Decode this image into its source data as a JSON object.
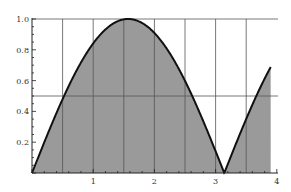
{
  "chart_data": {
    "type": "area",
    "title": "",
    "xlabel": "",
    "ylabel": "",
    "function": "|sin(x)|",
    "xlim": [
      0,
      4
    ],
    "ylim": [
      0,
      1.0
    ],
    "x_ticks": [
      "1",
      "2",
      "3",
      "4"
    ],
    "y_ticks": [
      "0.2",
      "0.4",
      "0.6",
      "0.8",
      "1.0"
    ],
    "grid": {
      "vertical": [
        0.5,
        1,
        1.5,
        2,
        2.5,
        3,
        3.5
      ],
      "horizontal": [
        0.5,
        1.0
      ]
    },
    "series": [
      {
        "name": "|sin(x)|",
        "x": [
          0,
          0.5,
          1.0,
          1.5,
          1.5708,
          2.0,
          2.5,
          3.0,
          3.1416,
          3.5,
          3.9
        ],
        "values": [
          0,
          0.479,
          0.841,
          0.997,
          1.0,
          0.909,
          0.598,
          0.141,
          0,
          0.351,
          0.688
        ]
      }
    ],
    "x_end": 3.9,
    "fill_color": "#9a9a9a",
    "line_color": "#111111",
    "grid_color": "#555555"
  }
}
